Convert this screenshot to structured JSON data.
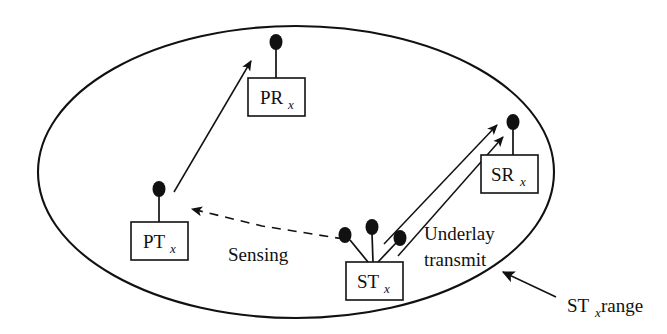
{
  "figure": {
    "type": "network-diagram",
    "background_color": "#ffffff",
    "line_color": "#111111",
    "width": 667,
    "height": 334
  },
  "boundary": {
    "shape": "ellipse",
    "name": "ST_x coverage range",
    "cx": 296,
    "cy": 172,
    "rx": 258,
    "ry": 146
  },
  "nodes": [
    {
      "id": "prx",
      "label": "PR",
      "subscript": "x",
      "meaning": "Primary Receiver",
      "box": {
        "x": 248,
        "y": 78,
        "w": 57,
        "h": 38
      },
      "antennas": [
        {
          "dx": 28,
          "height": 36,
          "tilt": 0
        }
      ]
    },
    {
      "id": "ptx",
      "label": "PT",
      "subscript": "x",
      "meaning": "Primary Transmitter",
      "box": {
        "x": 131,
        "y": 222,
        "w": 57,
        "h": 38
      },
      "antennas": [
        {
          "dx": 28,
          "height": 36,
          "tilt": 0
        }
      ]
    },
    {
      "id": "stx",
      "label": "ST",
      "subscript": "x",
      "meaning": "Secondary Transmitter",
      "box": {
        "x": 346,
        "y": 262,
        "w": 57,
        "h": 38
      },
      "antennas": [
        {
          "dx": 28,
          "height": 36,
          "tilt": -22
        },
        {
          "dx": 28,
          "height": 34,
          "tilt": 0
        },
        {
          "dx": 28,
          "height": 36,
          "tilt": 22
        }
      ]
    },
    {
      "id": "srx",
      "label": "SR",
      "subscript": "x",
      "meaning": "Secondary Receiver",
      "box": {
        "x": 481,
        "y": 155,
        "w": 57,
        "h": 38
      },
      "antennas": [
        {
          "dx": 28,
          "height": 36,
          "tilt": 0
        }
      ]
    }
  ],
  "links": [
    {
      "id": "primary-link",
      "style": "solid",
      "arrow": "end",
      "from": "ptx-antenna",
      "to": "prx-antenna",
      "label": ""
    },
    {
      "id": "sensing-link",
      "style": "dashed",
      "arrow": "end",
      "from": "stx-antenna-left",
      "to": "ptx-antenna",
      "label": "Sensing"
    },
    {
      "id": "underlay-link-1",
      "style": "solid",
      "arrow": "end",
      "from": "stx-antenna-center",
      "to": "srx-antenna",
      "label": ""
    },
    {
      "id": "underlay-link-2",
      "style": "solid",
      "arrow": "end",
      "from": "stx-antenna-right",
      "to": "srx-antenna",
      "label": ""
    },
    {
      "id": "range-pointer",
      "style": "solid",
      "arrow": "end",
      "from": "range-label",
      "to": "ellipse-boundary",
      "label": ""
    }
  ],
  "annotations": [
    {
      "id": "sensing",
      "text": "Sensing",
      "x": 228,
      "y": 254,
      "lines": [
        "Sensing"
      ]
    },
    {
      "id": "underlay-transmit",
      "text": "Underlay transmit",
      "x": 424,
      "y": 234,
      "lines": [
        "Underlay",
        "transmit"
      ]
    },
    {
      "id": "stx-range",
      "text": "ST",
      "subscript": "x",
      "text_tail": "range",
      "x": 571,
      "y": 307
    }
  ],
  "legend_text": {
    "sensing": "Sensing",
    "underlay_line1": "Underlay",
    "underlay_line2": "transmit",
    "range_prefix": "ST",
    "range_sub": "x",
    "range_suffix": "range"
  }
}
